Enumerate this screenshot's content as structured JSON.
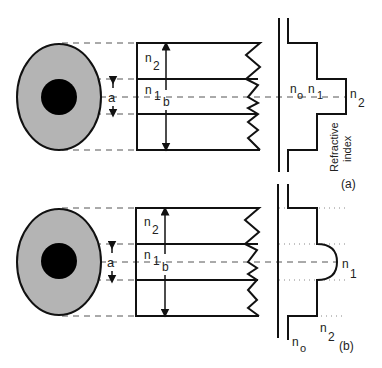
{
  "diagram": {
    "colors": {
      "cladding": "#b4b4b4",
      "core": "#000000",
      "line": "#111111",
      "dash": "#555555"
    },
    "panels": [
      {
        "id": "a",
        "caption": "(a)",
        "profile_type": "step-index",
        "labels": {
          "core_radius": "a",
          "cladding_radius": "b",
          "cladding_index": "n",
          "cladding_index_sub": "2",
          "core_index": "n",
          "core_index_sub": "1",
          "axis_n0": "n",
          "axis_n0_sub": "o",
          "axis_n1": "n",
          "axis_n1_sub": "1",
          "axis_n2": "n",
          "axis_n2_sub": "2",
          "axis_title_line1": "Refractive",
          "axis_title_line2": "index"
        }
      },
      {
        "id": "b",
        "caption": "(b)",
        "profile_type": "graded-index",
        "labels": {
          "core_radius": "a",
          "cladding_radius": "b",
          "cladding_index": "n",
          "cladding_index_sub": "2",
          "core_index": "n",
          "core_index_sub": "1",
          "peak_index": "n",
          "peak_index_sub": "1",
          "clad_level": "n",
          "clad_level_sub": "2",
          "axis_n0": "n",
          "axis_n0_sub": "o"
        }
      }
    ]
  }
}
